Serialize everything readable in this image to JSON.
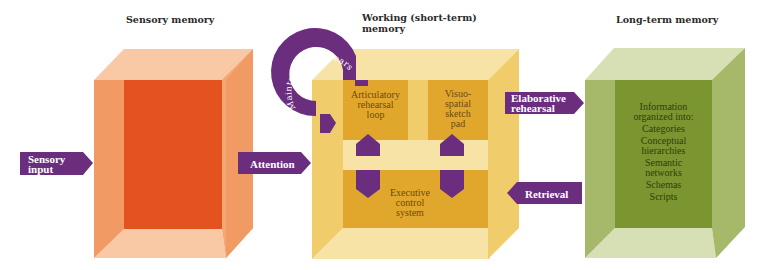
{
  "headings": {
    "sensory": "Sensory memory",
    "working_line1": "Working (short-term)",
    "working_line2": "memory",
    "longterm": "Long-term memory"
  },
  "arrows": {
    "sensory_input_1": "Sensory",
    "sensory_input_2": "input",
    "attention": "Attention",
    "elaborative_1": "Elaborative",
    "elaborative_2": "rehearsal",
    "retrieval": "Retrieval",
    "maintenance": "Maintenance rehearsal"
  },
  "working_memory": {
    "articulatory": [
      "Articulatory",
      "rehearsal",
      "loop"
    ],
    "visuospatial": [
      "Visuo-",
      "spatial",
      "sketch",
      "pad"
    ],
    "executive": [
      "Executive",
      "control",
      "system"
    ]
  },
  "long_term": {
    "intro": [
      "Information",
      "organized into:"
    ],
    "items": [
      "Categories",
      "Conceptual",
      "hierarchies",
      "Semantic",
      "networks",
      "Schemas",
      "Scripts"
    ]
  },
  "colors": {
    "arrow_purple": "#6b2d7e",
    "sensory_dark": "#e4531f",
    "sensory_side": "#f19a64",
    "sensory_light": "#f8c9a4",
    "working_dark": "#e0a72c",
    "working_mid": "#f0cd6a",
    "working_light": "#f8e3a6",
    "longterm_dark": "#7b9630",
    "longterm_mid": "#a6b96a",
    "longterm_light": "#d7e0b5"
  }
}
